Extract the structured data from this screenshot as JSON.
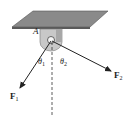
{
  "diagram": {
    "type": "statics-force-diagram",
    "point_label": "A",
    "forces": [
      {
        "name": "F",
        "subscript": "1",
        "direction": "down-left"
      },
      {
        "name": "F",
        "subscript": "2",
        "direction": "down-right"
      }
    ],
    "angles": [
      {
        "symbol": "θ",
        "subscript": "1",
        "between": "F1 and vertical"
      },
      {
        "symbol": "θ",
        "subscript": "2",
        "between": "F2 and vertical"
      }
    ],
    "reference_line": "vertical dashed line",
    "colors": {
      "plate_top": "#8a8a8a",
      "plate_edge": "#5a5a5a",
      "bracket": "#c8c8c8",
      "lines": "#222222"
    }
  }
}
